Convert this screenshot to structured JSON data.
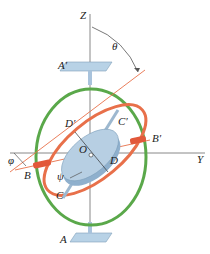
{
  "diagram": {
    "labels": {
      "z_axis": "Z",
      "y_axis": "Y",
      "theta": "θ",
      "phi": "φ",
      "psi": "ψ",
      "a_prime": "A′",
      "a": "A",
      "b": "B",
      "b_prime": "B′",
      "c": "C",
      "c_prime": "C′",
      "d": "D",
      "d_prime": "D′",
      "o": "O"
    },
    "colors": {
      "outer_gimbal": "#5aa84a",
      "inner_gimbal": "#e8704a",
      "rotor": "#a9c3dc",
      "axis": "#777777",
      "bracket": "#b8d2e6"
    }
  }
}
